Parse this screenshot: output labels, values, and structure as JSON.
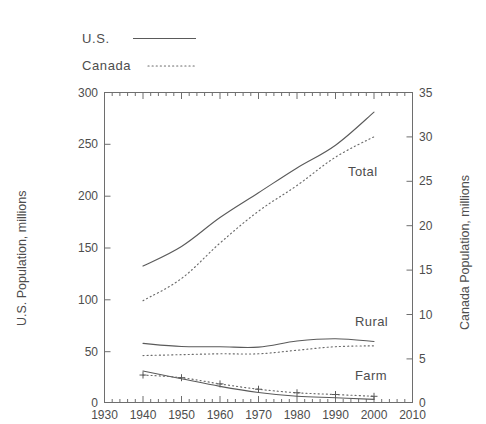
{
  "figure": {
    "top_note": "",
    "legend": [
      {
        "label": "U.S.",
        "style": "solid"
      },
      {
        "label": "Canada",
        "style": "dotted"
      }
    ],
    "series_labels": [
      {
        "name": "total-label",
        "text": "Total"
      },
      {
        "name": "rural-label",
        "text": "Rural"
      },
      {
        "name": "farm-label",
        "text": "Farm"
      }
    ]
  },
  "chart_data": {
    "type": "line",
    "title": "",
    "xlabel": "",
    "ylabel": "U.S. Population, millions",
    "y2label": "Canada Population, millions",
    "xlim": [
      1930,
      2010
    ],
    "ylim": [
      0,
      300
    ],
    "y2lim": [
      0,
      35
    ],
    "grid": false,
    "legend_position": "above-plot-left",
    "x_ticks": [
      1930,
      1940,
      1950,
      1960,
      1970,
      1980,
      1990,
      2000,
      2010
    ],
    "x_tick_labels": [
      "1930",
      "1940",
      "1950",
      "1960",
      "1970",
      "1980",
      "1990",
      "2000",
      "2010"
    ],
    "x_minor_tick_interval": 2,
    "y_ticks": [
      0,
      50,
      100,
      150,
      200,
      250,
      300
    ],
    "y_tick_labels": [
      "0",
      "50",
      "100",
      "150",
      "200",
      "250",
      "300"
    ],
    "y2_ticks": [
      0,
      5,
      10,
      15,
      20,
      25,
      30,
      35
    ],
    "y2_tick_labels": [
      "0",
      "5",
      "10",
      "15",
      "20",
      "25",
      "30",
      "35"
    ],
    "x": [
      1940,
      1950,
      1960,
      1970,
      1980,
      1990,
      2000
    ],
    "series": [
      {
        "name": "U.S. Total",
        "country": "U.S.",
        "category": "Total",
        "axis": "left",
        "style": "solid",
        "values": [
          132,
          151,
          179,
          203,
          227,
          249,
          281
        ]
      },
      {
        "name": "Canada Total",
        "country": "Canada",
        "category": "Total",
        "axis": "right",
        "style": "dotted",
        "values": [
          11.5,
          14.0,
          18.0,
          21.6,
          24.5,
          27.7,
          30.0
        ]
      },
      {
        "name": "U.S. Rural",
        "country": "U.S.",
        "category": "Rural",
        "axis": "left",
        "style": "solid",
        "values": [
          57.2,
          54.2,
          54.0,
          53.6,
          59.5,
          61.7,
          59.0
        ]
      },
      {
        "name": "Canada Rural",
        "country": "Canada",
        "category": "Rural",
        "axis": "right",
        "style": "dotted",
        "values": [
          5.3,
          5.4,
          5.5,
          5.5,
          5.9,
          6.3,
          6.4
        ]
      },
      {
        "name": "U.S. Farm",
        "country": "U.S.",
        "category": "Farm",
        "axis": "left",
        "style": "solid",
        "values": [
          30.5,
          23.0,
          15.6,
          9.7,
          6.0,
          4.6,
          3.0
        ]
      },
      {
        "name": "Canada Farm",
        "country": "Canada",
        "category": "Farm",
        "axis": "right",
        "style": "dotted-plus",
        "values": [
          3.1,
          2.8,
          2.1,
          1.5,
          1.1,
          0.9,
          0.7
        ]
      }
    ]
  }
}
